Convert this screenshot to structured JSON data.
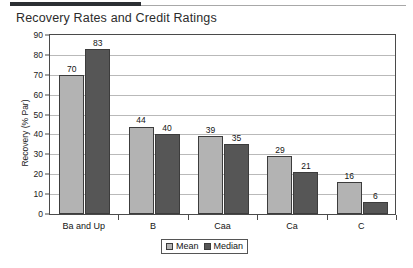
{
  "chart_data": {
    "type": "bar",
    "title": "Recovery Rates and Credit Ratings",
    "xlabel": "",
    "ylabel": "Recovery (% Par)",
    "ylim": [
      0,
      90
    ],
    "ytick_step": 10,
    "yticks": [
      "90",
      "80",
      "70",
      "60",
      "50",
      "40",
      "30",
      "20",
      "10",
      "0"
    ],
    "grid": true,
    "legend_position": "bottom-center",
    "categories": [
      "Ba and Up",
      "B",
      "Caa",
      "Ca",
      "C"
    ],
    "series": [
      {
        "name": "Mean",
        "color": "#b3b3b3",
        "values": [
          70,
          44,
          39,
          29,
          16
        ]
      },
      {
        "name": "Median",
        "color": "#565656",
        "values": [
          83,
          40,
          35,
          21,
          6
        ]
      }
    ]
  },
  "legend": {
    "entries": [
      {
        "label": "Mean"
      },
      {
        "label": "Median"
      }
    ]
  }
}
